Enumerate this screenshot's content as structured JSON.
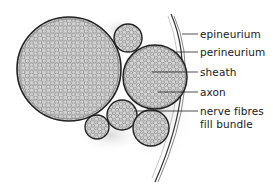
{
  "labels": [
    {
      "id": "epineurium",
      "text": "epineurium",
      "y": 28,
      "line_from_x": 178,
      "line_y": 34
    },
    {
      "id": "perineurium",
      "text": "perineurium",
      "y": 46,
      "line_from_x": 172,
      "line_y": 52
    },
    {
      "id": "sheath",
      "text": "sheath",
      "y": 66,
      "line_from_x": 152,
      "line_y": 72
    },
    {
      "id": "axon",
      "text": "axon",
      "y": 86,
      "line_from_x": 158,
      "line_y": 92
    },
    {
      "id": "nerve-fibres",
      "text": "nerve fibres",
      "y": 105,
      "line_from_x": 134,
      "line_y": 111
    },
    {
      "id": "fill-bundle",
      "text": "fill bundle",
      "y": 118
    }
  ],
  "bundles": [
    {
      "name": "large-bundle",
      "cx": 69,
      "cy": 69,
      "r": 52
    },
    {
      "name": "top-small-bundle",
      "cx": 128,
      "cy": 38,
      "r": 14
    },
    {
      "name": "right-bundle",
      "cx": 155,
      "cy": 77,
      "r": 32
    },
    {
      "name": "middle-bundle",
      "cx": 122,
      "cy": 115,
      "r": 15
    },
    {
      "name": "bottom-left-bundle",
      "cx": 97,
      "cy": 127,
      "r": 12
    },
    {
      "name": "bottom-right-bundle",
      "cx": 151,
      "cy": 128,
      "r": 18
    }
  ],
  "colors": {
    "ink": "#1a1a1a",
    "fibre_fill": "#ffffff",
    "bundle_bg": "#cfcfcf",
    "shade": "#bdbdbd"
  }
}
